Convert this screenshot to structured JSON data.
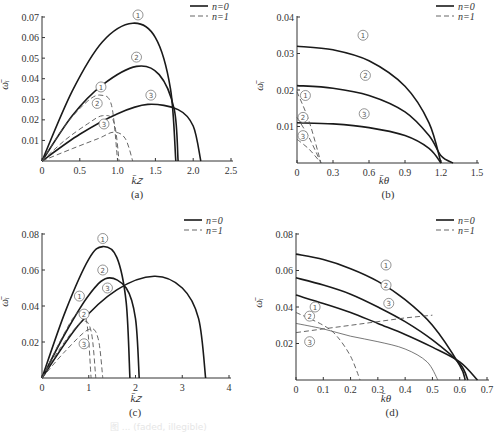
{
  "legend": {
    "solid_label": "n=0",
    "dashed_label": "n=1"
  },
  "caption": "图 ... (faded, illegible)",
  "chart_data": [
    {
      "id": "a",
      "type": "line",
      "panel_label": "(a)",
      "xlabel": "k̄_z",
      "ylabel": "ω̄_i",
      "xlim": [
        0,
        2.5
      ],
      "ylim": [
        0,
        0.07
      ],
      "xticks": [
        "0",
        "0.5",
        "1.0",
        "1.5",
        "2.0",
        "2.5"
      ],
      "yticks": [
        "0.01",
        "0.02",
        "0.03",
        "0.04",
        "0.05",
        "0.06",
        "0.07"
      ],
      "legend": [
        "n=0",
        "n=1"
      ],
      "series": [
        {
          "name": "n=0 ①",
          "style": "solid",
          "x": [
            0,
            0.4,
            0.8,
            1.2,
            1.5,
            1.7,
            1.77
          ],
          "y": [
            0,
            0.034,
            0.058,
            0.067,
            0.06,
            0.035,
            0
          ]
        },
        {
          "name": "n=0 ②",
          "style": "solid",
          "x": [
            0,
            0.4,
            0.8,
            1.25,
            1.55,
            1.75,
            1.8
          ],
          "y": [
            0,
            0.022,
            0.037,
            0.046,
            0.042,
            0.025,
            0
          ]
        },
        {
          "name": "n=0 ③",
          "style": "solid",
          "x": [
            0,
            0.5,
            1.0,
            1.4,
            1.8,
            2.0,
            2.1
          ],
          "y": [
            0,
            0.013,
            0.023,
            0.0275,
            0.025,
            0.017,
            0
          ]
        },
        {
          "name": "n=1 ①",
          "style": "dashed",
          "x": [
            0,
            0.3,
            0.6,
            0.78,
            0.92,
            1.0
          ],
          "y": [
            0,
            0.017,
            0.029,
            0.032,
            0.027,
            0
          ]
        },
        {
          "name": "n=1 ②",
          "style": "dashed",
          "x": [
            0,
            0.3,
            0.6,
            0.8,
            0.95,
            1.02
          ],
          "y": [
            0,
            0.01,
            0.018,
            0.022,
            0.019,
            0
          ]
        },
        {
          "name": "n=1 ③",
          "style": "dashed",
          "x": [
            0,
            0.4,
            0.75,
            0.95,
            1.1,
            1.2
          ],
          "y": [
            0,
            0.006,
            0.011,
            0.014,
            0.011,
            0
          ]
        }
      ]
    },
    {
      "id": "b",
      "type": "line",
      "panel_label": "(b)",
      "xlabel": "k̄_θ",
      "ylabel": "ω̄_i",
      "xlim": [
        0,
        1.5
      ],
      "ylim": [
        0,
        0.04
      ],
      "xticks": [
        "0",
        "0.3",
        "0.6",
        "0.9",
        "1.2",
        "1.5"
      ],
      "yticks": [
        "0.01",
        "0.02",
        "0.03",
        "0.04"
      ],
      "legend": [
        "n=0",
        "n=1"
      ],
      "series": [
        {
          "name": "n=0 ①",
          "style": "solid",
          "x": [
            0,
            0.3,
            0.6,
            0.9,
            1.1,
            1.2
          ],
          "y": [
            0.032,
            0.031,
            0.028,
            0.021,
            0.011,
            0
          ]
        },
        {
          "name": "n=0 ②",
          "style": "solid",
          "x": [
            0,
            0.3,
            0.6,
            0.9,
            1.1,
            1.2,
            1.3
          ],
          "y": [
            0.0212,
            0.0205,
            0.0185,
            0.014,
            0.0075,
            0.002,
            0
          ]
        },
        {
          "name": "n=0 ③",
          "style": "solid",
          "x": [
            0,
            0.3,
            0.6,
            0.9,
            1.1,
            1.2
          ],
          "y": [
            0.011,
            0.0107,
            0.0097,
            0.0075,
            0.004,
            0
          ]
        },
        {
          "name": "n=1 ①",
          "style": "dashed",
          "x": [
            0,
            0.1,
            0.2
          ],
          "y": [
            0.0195,
            0.0115,
            0
          ]
        },
        {
          "name": "n=1 ②",
          "style": "dashed",
          "x": [
            0,
            0.1,
            0.2
          ],
          "y": [
            0.0125,
            0.007,
            0
          ]
        },
        {
          "name": "n=1 ③",
          "style": "dashed",
          "x": [
            0,
            0.1,
            0.2
          ],
          "y": [
            0.0065,
            0.0038,
            0
          ]
        }
      ]
    },
    {
      "id": "c",
      "type": "line",
      "panel_label": "(c)",
      "xlabel": "k̄_z",
      "ylabel": "ω̄_i",
      "xlim": [
        0,
        4
      ],
      "ylim": [
        0,
        0.08
      ],
      "xticks": [
        "0",
        "1",
        "2",
        "3",
        "4"
      ],
      "yticks": [
        "0.02",
        "0.04",
        "0.06",
        "0.08"
      ],
      "legend": [
        "n=0",
        "n=1"
      ],
      "series": [
        {
          "name": "n=0 ①",
          "style": "solid",
          "x": [
            0,
            0.5,
            1.0,
            1.3,
            1.6,
            1.8,
            1.88
          ],
          "y": [
            0,
            0.037,
            0.066,
            0.073,
            0.067,
            0.042,
            0
          ]
        },
        {
          "name": "n=0 ②",
          "style": "solid",
          "x": [
            0,
            0.5,
            1.0,
            1.4,
            1.8,
            2.0,
            2.08
          ],
          "y": [
            0,
            0.025,
            0.046,
            0.0555,
            0.05,
            0.033,
            0
          ]
        },
        {
          "name": "n=0 ③",
          "style": "solid",
          "x": [
            0,
            0.8,
            1.6,
            2.4,
            3.0,
            3.35,
            3.5
          ],
          "y": [
            0,
            0.03,
            0.049,
            0.0565,
            0.05,
            0.033,
            0
          ]
        },
        {
          "name": "n=1 ①",
          "style": "dashed",
          "x": [
            0,
            0.4,
            0.75,
            0.95,
            1.05
          ],
          "y": [
            0,
            0.021,
            0.036,
            0.032,
            0
          ]
        },
        {
          "name": "n=1 ②",
          "style": "dashed",
          "x": [
            0,
            0.4,
            0.85,
            1.05,
            1.15
          ],
          "y": [
            0,
            0.017,
            0.031,
            0.026,
            0
          ]
        },
        {
          "name": "n=1 ③",
          "style": "dashed",
          "x": [
            0,
            0.5,
            1.0,
            1.2,
            1.3
          ],
          "y": [
            0,
            0.015,
            0.027,
            0.022,
            0
          ]
        }
      ]
    },
    {
      "id": "d",
      "type": "line",
      "panel_label": "(d)",
      "xlabel": "k̄_θ",
      "ylabel": "ω̄_i",
      "xlim": [
        0,
        0.7
      ],
      "ylim": [
        0,
        0.08
      ],
      "xticks": [
        "0",
        "0.1",
        "0.2",
        "0.3",
        "0.4",
        "0.5",
        "0.6",
        "0.7"
      ],
      "yticks": [
        "0.02",
        "0.04",
        "0.06",
        "0.08"
      ],
      "legend": [
        "n=0",
        "n=1"
      ],
      "series": [
        {
          "name": "n=0 ①",
          "style": "solid",
          "x": [
            0,
            0.1,
            0.2,
            0.3,
            0.4,
            0.5,
            0.6,
            0.62
          ],
          "y": [
            0.069,
            0.066,
            0.061,
            0.054,
            0.044,
            0.03,
            0.008,
            0
          ]
        },
        {
          "name": "n=0 ②",
          "style": "solid",
          "x": [
            0,
            0.1,
            0.2,
            0.3,
            0.4,
            0.5,
            0.6,
            0.63
          ],
          "y": [
            0.056,
            0.052,
            0.047,
            0.04,
            0.032,
            0.022,
            0.009,
            0
          ]
        },
        {
          "name": "n=0 ③",
          "style": "solid",
          "x": [
            0,
            0.1,
            0.2,
            0.3,
            0.4,
            0.5,
            0.6,
            0.665
          ],
          "y": [
            0.0465,
            0.042,
            0.037,
            0.031,
            0.025,
            0.018,
            0.01,
            0
          ]
        },
        {
          "name": "n=1 ①",
          "style": "dashed",
          "x": [
            0,
            0.1,
            0.15,
            0.2,
            0.235
          ],
          "y": [
            0.037,
            0.03,
            0.024,
            0.013,
            0
          ]
        },
        {
          "name": "n=1 ②",
          "style": "dashed",
          "x": [
            0,
            0.1,
            0.2,
            0.3,
            0.4,
            0.48,
            0.52
          ],
          "y": [
            0.031,
            0.028,
            0.024,
            0.021,
            0.017,
            0.01,
            0
          ]
        },
        {
          "name": "n=1 ③",
          "style": "dashed",
          "x": [
            0,
            0.1,
            0.2,
            0.3,
            0.4,
            0.5
          ],
          "y": [
            0.026,
            0.028,
            0.03,
            0.032,
            0.034,
            0.0355
          ]
        }
      ]
    }
  ]
}
